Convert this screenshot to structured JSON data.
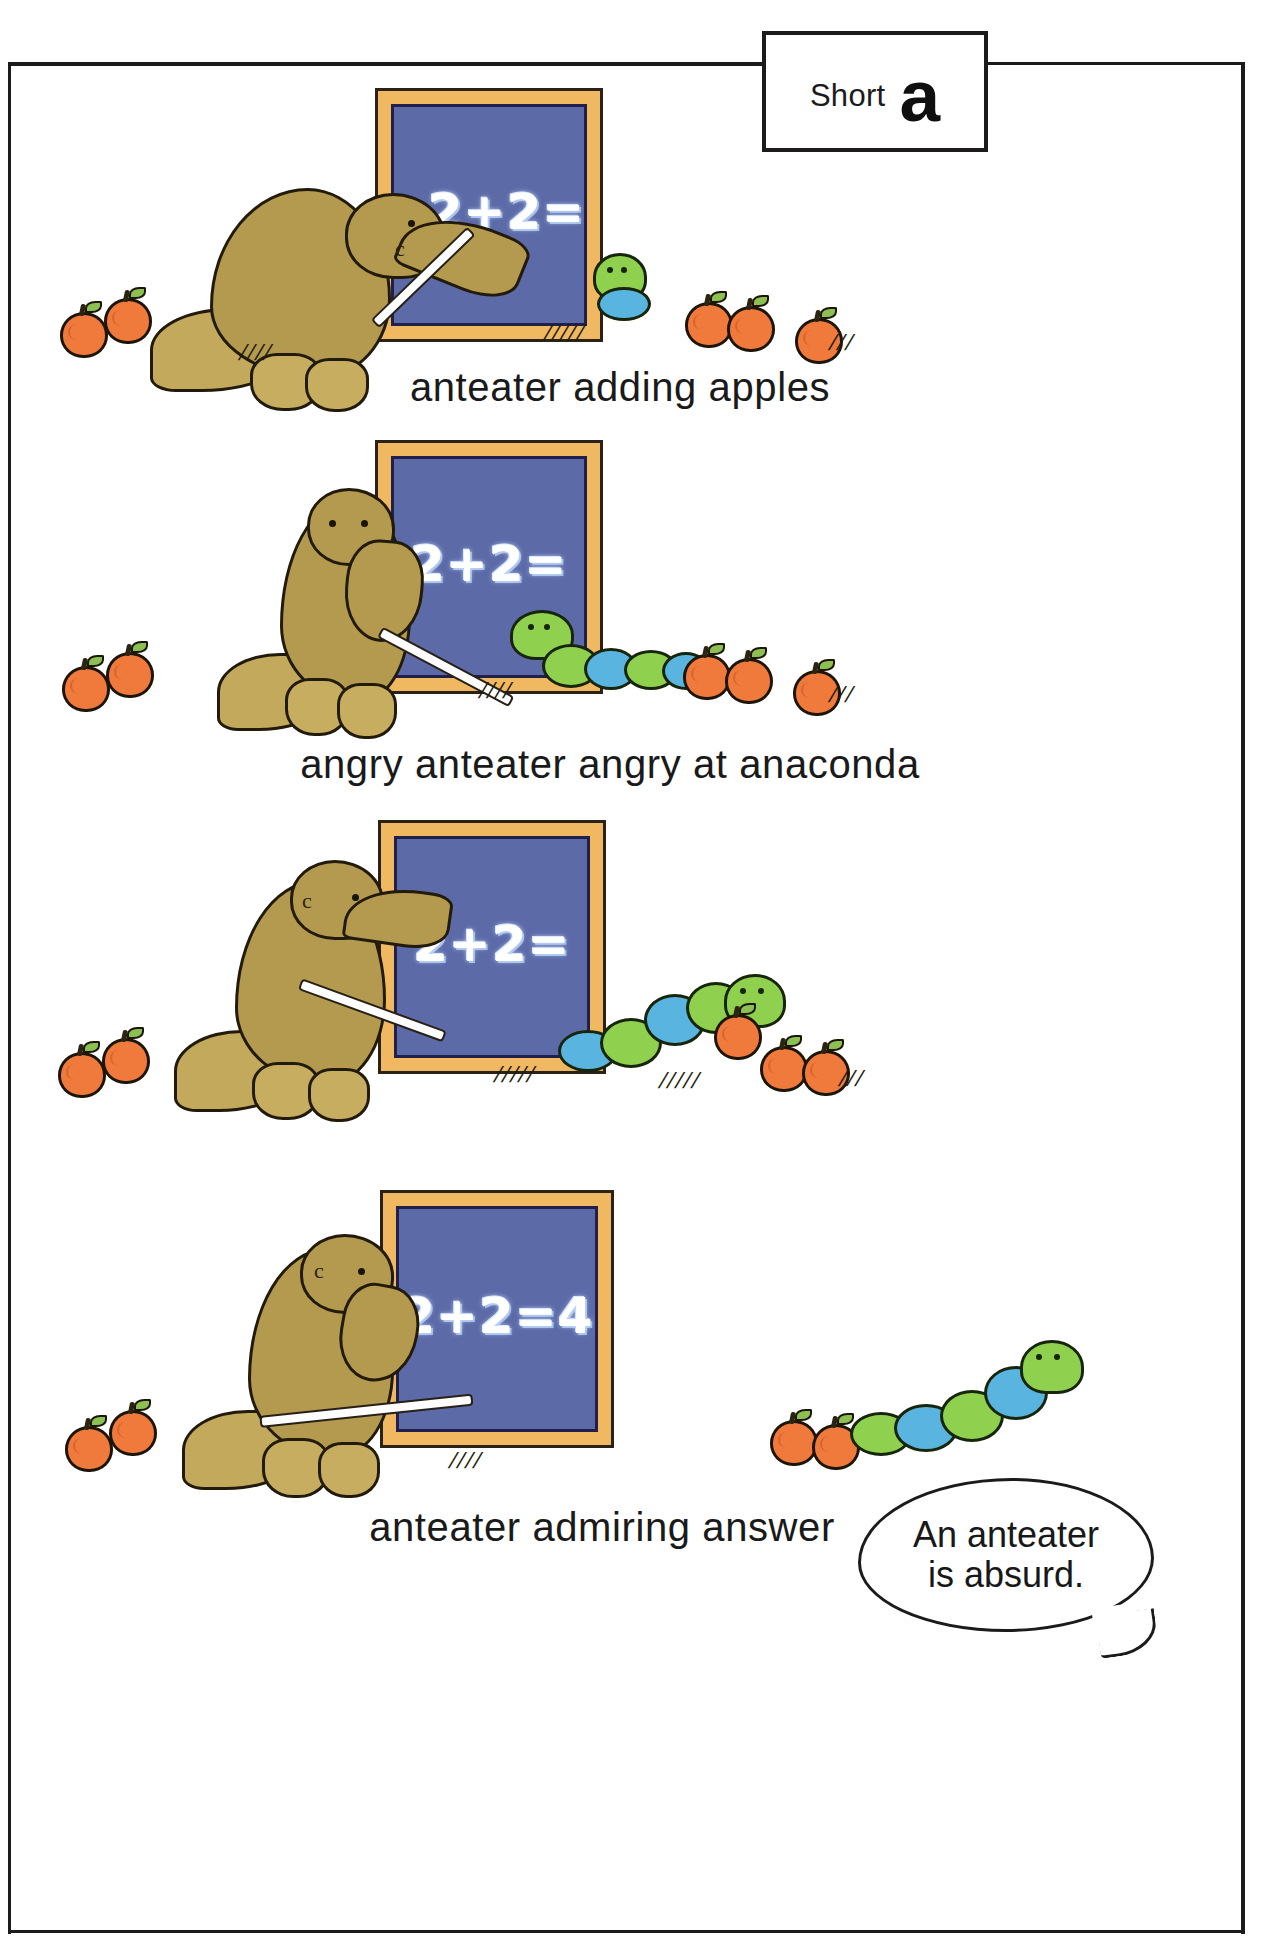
{
  "page": {
    "label_box": {
      "word": "Short",
      "letter": "a"
    },
    "frame_color": "#1c1a1a",
    "background": "#ffffff"
  },
  "palette": {
    "board_frame": "#f0b860",
    "board_slate": "#5c6aa8",
    "chalk": "#ffffff",
    "anteater_fur": "#b49a4e",
    "anaconda_green": "#8fd14f",
    "anaconda_blue": "#5ab4e0",
    "apple": "#f07a3c",
    "apple_leaf": "#8cc152",
    "ink": "#1c1a1a"
  },
  "panels": [
    {
      "id": "panel-1",
      "caption": "anteater adding apples",
      "blackboard_text": "2+2=",
      "apples_left": 2,
      "apples_right": 3,
      "characters": [
        "anteater",
        "anaconda"
      ],
      "anteater_mark": "c"
    },
    {
      "id": "panel-2",
      "caption": "angry anteater angry at anaconda",
      "blackboard_text": "2+2=",
      "apples_left": 2,
      "apples_right": 3,
      "characters": [
        "anteater",
        "anaconda"
      ],
      "anteater_mark": ""
    },
    {
      "id": "panel-3",
      "caption": "",
      "blackboard_text": "2+2=",
      "apples_left": 2,
      "apples_right": 2,
      "characters": [
        "anteater",
        "anaconda"
      ],
      "anteater_mark": "c"
    },
    {
      "id": "panel-4",
      "caption": "anteater admiring answer",
      "blackboard_text": "2+2=4",
      "apples_left": 2,
      "apples_right": 2,
      "characters": [
        "anteater",
        "anaconda"
      ],
      "anteater_mark": "c",
      "speech_bubble": {
        "line1": "An anteater",
        "line2": "is absurd."
      }
    }
  ]
}
